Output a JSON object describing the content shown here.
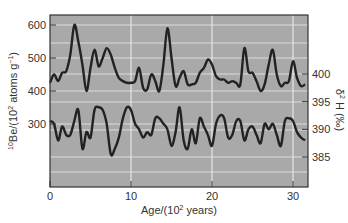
{
  "chart_data": [
    {
      "type": "line",
      "title": "",
      "xlabel": "Age/(10^2 years)",
      "ylabel": "10Be/(10^2 atoms g^-1)",
      "xlim": [
        0,
        32
      ],
      "ylim": [
        120,
        650
      ],
      "xticks": [
        0,
        10,
        20,
        30
      ],
      "yticks": [
        300,
        400,
        500,
        600
      ],
      "grid": true,
      "series": [
        {
          "name": "10Be",
          "x": [
            0,
            0.5,
            1,
            1.5,
            2,
            2.5,
            3,
            3.5,
            4,
            4.5,
            5,
            5.5,
            6,
            6.5,
            7,
            7.5,
            8,
            8.5,
            9,
            9.5,
            10,
            10.5,
            11,
            11.5,
            12,
            12.5,
            13,
            13.5,
            14,
            14.5,
            15,
            15.5,
            16,
            16.5,
            17,
            17.5,
            18,
            18.5,
            19,
            19.5,
            20,
            20.5,
            21,
            21.5,
            22,
            22.5,
            23,
            23.5,
            24,
            24.5,
            25,
            25.5,
            26,
            26.5,
            27,
            27.5,
            28,
            28.5,
            29,
            29.5,
            30,
            30.5,
            31,
            31.5
          ],
          "values": [
            425,
            450,
            430,
            455,
            460,
            510,
            600,
            550,
            480,
            400,
            470,
            525,
            475,
            500,
            530,
            510,
            470,
            440,
            430,
            425,
            425,
            430,
            470,
            410,
            405,
            450,
            430,
            400,
            480,
            590,
            500,
            415,
            440,
            460,
            420,
            420,
            425,
            455,
            470,
            495,
            480,
            445,
            435,
            435,
            425,
            430,
            425,
            420,
            530,
            460,
            455,
            430,
            400,
            420,
            480,
            525,
            450,
            415,
            425,
            430,
            490,
            440,
            415,
            420
          ]
        },
        {
          "name": "δ2H (‰)",
          "x": [
            0,
            0.5,
            1,
            1.5,
            2,
            2.5,
            3,
            3.5,
            4,
            4.5,
            5,
            5.5,
            6,
            6.5,
            7,
            7.5,
            8,
            8.5,
            9,
            9.5,
            10,
            10.5,
            11,
            11.5,
            12,
            12.5,
            13,
            13.5,
            14,
            14.5,
            15,
            15.5,
            16,
            16.5,
            17,
            17.5,
            18,
            18.5,
            19,
            19.5,
            20,
            20.5,
            21,
            21.5,
            22,
            22.5,
            23,
            23.5,
            24,
            24.5,
            25,
            25.5,
            26,
            26.5,
            27,
            27.5,
            28,
            28.5,
            29,
            29.5,
            30,
            30.5,
            31,
            31.5
          ],
          "values": [
            391.5,
            391,
            388,
            390.5,
            389,
            389,
            391.5,
            393.5,
            386.5,
            389.5,
            388.5,
            393.5,
            394,
            393.5,
            391,
            385.5,
            386.5,
            388.5,
            392,
            394,
            393.5,
            391,
            390,
            388.5,
            389.5,
            389,
            392,
            392,
            391,
            390,
            387,
            389.5,
            394,
            388,
            386.5,
            390,
            387.5,
            392,
            390.5,
            389,
            387,
            391,
            392.5,
            392,
            388.5,
            389,
            391.5,
            391.5,
            388,
            390,
            390.5,
            389,
            387.5,
            391,
            390,
            391,
            389,
            387,
            391.5,
            392,
            391.5,
            389.5,
            388.5,
            388
          ]
        }
      ],
      "secondary_axis": {
        "label": "δ2 H (‰)",
        "yticks": [
          385,
          390,
          395,
          400
        ],
        "position": "right"
      }
    }
  ],
  "labels": {
    "x_axis_title": "Age/(10",
    "x_axis_title_sup": "2",
    "x_axis_title_end": " years)",
    "y_left_pre": "10",
    "y_left_main": "Be/(10",
    "y_left_sup": "2",
    "y_left_mid": " atoms g",
    "y_left_sup2": "−1",
    "y_left_end": ")",
    "y_right_sup": "2",
    "y_right_main": "δ",
    "y_right_end": " H (‰)",
    "x_ticks": [
      "0",
      "10",
      "20",
      "30"
    ],
    "y_left_ticks": [
      "600",
      "500",
      "400",
      "300"
    ],
    "y_right_ticks": [
      "400",
      "395",
      "390",
      "385"
    ]
  },
  "colors": {
    "plot_background": "#a9a9a9",
    "gridline": "#e6e6e6",
    "line": "#222222",
    "frame": "#333333"
  }
}
